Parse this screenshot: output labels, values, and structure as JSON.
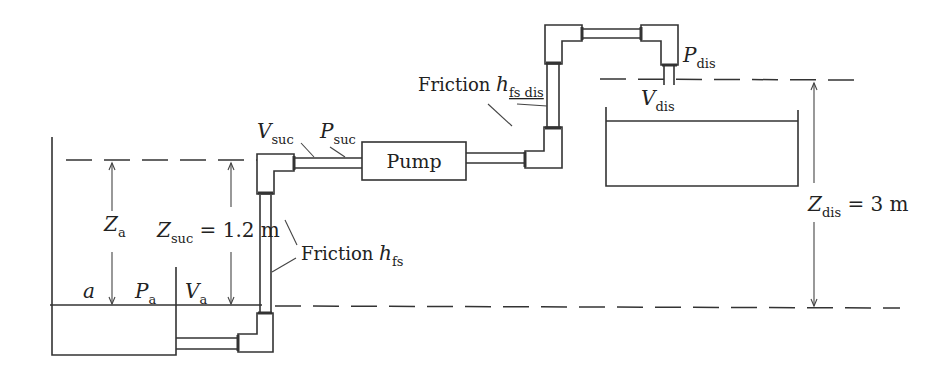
{
  "diagram": {
    "type": "pump suction/discharge system schematic",
    "labels": {
      "point_a": "a",
      "pressure_a": {
        "main": "P",
        "sub": "a"
      },
      "velocity_a": {
        "main": "V",
        "sub": "a"
      },
      "height_a": {
        "main": "Z",
        "sub": "a"
      },
      "height_suc": {
        "main": "Z",
        "sub": "suc",
        "value": " = 1.2 m"
      },
      "velocity_suc": {
        "main": "V",
        "sub": "suc"
      },
      "pressure_suc": {
        "main": "P",
        "sub": "suc"
      },
      "pump": "Pump",
      "friction_suc": {
        "text": "Friction ",
        "main": "h",
        "sub": "fs"
      },
      "friction_dis": {
        "text": "Friction ",
        "main": "h",
        "sub": "fs dis"
      },
      "pressure_dis": {
        "main": "P",
        "sub": "dis"
      },
      "velocity_dis": {
        "main": "V",
        "sub": "dis"
      },
      "height_dis": {
        "main": "Z",
        "sub": "dis",
        "value": " = 3 m"
      }
    },
    "values": {
      "Z_suc_m": 1.2,
      "Z_dis_m": 3
    }
  }
}
